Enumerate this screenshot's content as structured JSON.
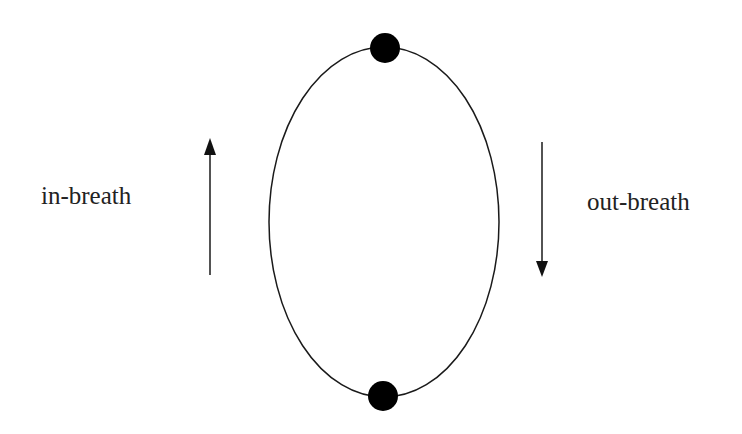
{
  "diagram": {
    "labels": {
      "in_breath": "in-breath",
      "out_breath": "out-breath"
    },
    "ellipse": {
      "cx": 384,
      "cy": 222,
      "rx": 115,
      "ry": 175
    },
    "nodes": [
      {
        "name": "top",
        "cx": 385,
        "cy": 48,
        "r": 15
      },
      {
        "name": "bottom",
        "cx": 383,
        "cy": 396,
        "r": 15
      }
    ],
    "arrows": [
      {
        "name": "in-breath",
        "direction": "up",
        "x": 210,
        "y_start": 275,
        "y_end": 138
      },
      {
        "name": "out-breath",
        "direction": "down",
        "x": 542,
        "y_start": 142,
        "y_end": 277
      }
    ],
    "colors": {
      "stroke": "#1a1a1a",
      "text": "#222222",
      "background": "#ffffff"
    }
  }
}
